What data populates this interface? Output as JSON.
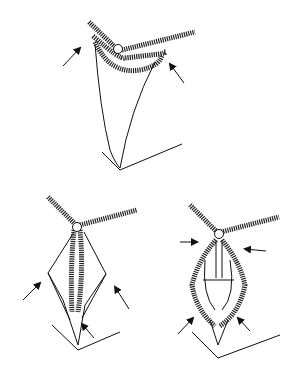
{
  "figure": {
    "colors": {
      "ink": "#111111",
      "background": "#ffffff"
    },
    "panels": [
      {
        "id": "top",
        "arrows": 2
      },
      {
        "id": "bottom-left",
        "arrows": 3
      },
      {
        "id": "bottom-right",
        "arrows": 4
      }
    ]
  }
}
